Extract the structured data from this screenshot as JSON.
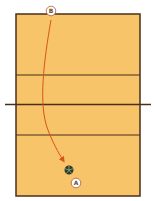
{
  "diagram": {
    "type": "volleyball-court",
    "colors": {
      "court": "#f7c469",
      "lines": "#4a2e1a",
      "path": "#d9531e",
      "marker_fill": "#ffffff",
      "marker_stroke": "#b0573a"
    },
    "markers": [
      {
        "id": "B",
        "label": "B"
      },
      {
        "id": "A",
        "label": "A"
      }
    ],
    "path": {
      "from": "B",
      "to": "ball",
      "style": "curved-arrow"
    },
    "ball": {
      "label": "ball"
    }
  }
}
